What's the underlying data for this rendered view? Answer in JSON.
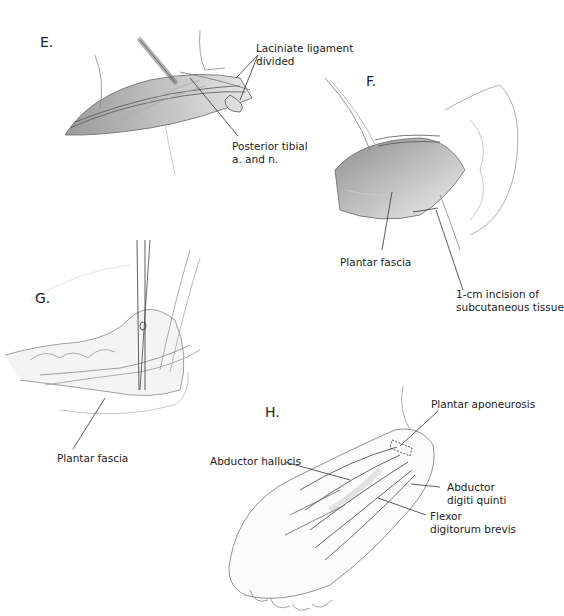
{
  "figure": {
    "panels": [
      {
        "id": "E",
        "letter": "E.",
        "labels": [
          {
            "text": "Laciniate ligament\ndivided"
          },
          {
            "text": "Posterior tibial\na. and n."
          }
        ]
      },
      {
        "id": "F",
        "letter": "F.",
        "labels": [
          {
            "text": "Plantar fascia"
          },
          {
            "text": "1-cm incision of\nsubcutaneous tissue"
          }
        ]
      },
      {
        "id": "G",
        "letter": "G.",
        "labels": [
          {
            "text": "Plantar fascia"
          }
        ]
      },
      {
        "id": "H",
        "letter": "H.",
        "labels": [
          {
            "text": "Plantar aponeurosis"
          },
          {
            "text": "Abductor hallucis"
          },
          {
            "text": "Abductor\ndigiti quinti"
          },
          {
            "text": "Flexor\ndigitorum brevis"
          }
        ]
      }
    ],
    "colors": {
      "ink": "#222222",
      "line": "#555555",
      "shade": "#b8b8b8",
      "light_shade": "#e2e2e2"
    }
  }
}
